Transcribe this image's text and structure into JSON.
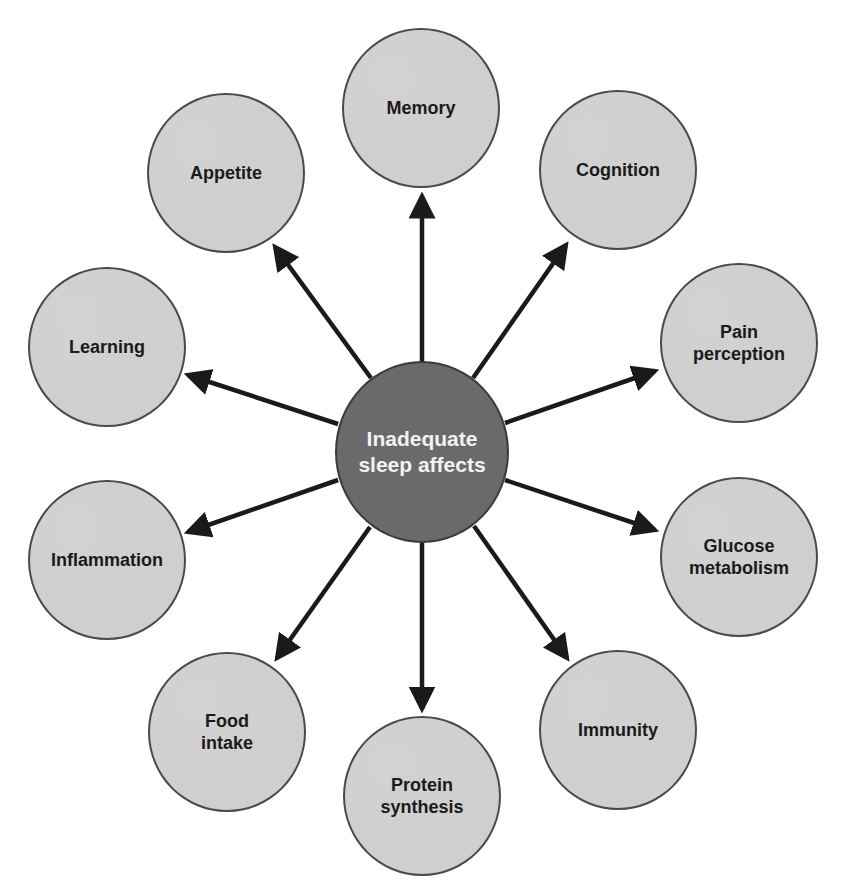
{
  "diagram": {
    "type": "hub-and-spoke",
    "colors": {
      "center_fill": "#6a6a6a",
      "center_text": "#f2f2f2",
      "outer_fill": "#cfcfcf",
      "outer_text": "#1a1a1a",
      "stroke": "#4a4a4a",
      "arrow": "#1a1a1a"
    },
    "center": {
      "label_line1": "Inadequate",
      "label_line2": "sleep affects"
    },
    "nodes": [
      {
        "id": "memory",
        "line1": "Memory",
        "line2": ""
      },
      {
        "id": "cognition",
        "line1": "Cognition",
        "line2": ""
      },
      {
        "id": "pain-perception",
        "line1": "Pain",
        "line2": "perception"
      },
      {
        "id": "glucose-metabolism",
        "line1": "Glucose",
        "line2": "metabolism"
      },
      {
        "id": "immunity",
        "line1": "Immunity",
        "line2": ""
      },
      {
        "id": "protein-synthesis",
        "line1": "Protein",
        "line2": "synthesis"
      },
      {
        "id": "food-intake",
        "line1": "Food",
        "line2": "intake"
      },
      {
        "id": "inflammation",
        "line1": "Inflammation",
        "line2": ""
      },
      {
        "id": "learning",
        "line1": "Learning",
        "line2": ""
      },
      {
        "id": "appetite",
        "line1": "Appetite",
        "line2": ""
      }
    ],
    "edges": [
      {
        "from": "center",
        "to": "memory"
      },
      {
        "from": "center",
        "to": "cognition"
      },
      {
        "from": "center",
        "to": "pain-perception"
      },
      {
        "from": "center",
        "to": "glucose-metabolism"
      },
      {
        "from": "center",
        "to": "immunity"
      },
      {
        "from": "center",
        "to": "protein-synthesis"
      },
      {
        "from": "center",
        "to": "food-intake"
      },
      {
        "from": "center",
        "to": "inflammation"
      },
      {
        "from": "center",
        "to": "learning"
      },
      {
        "from": "center",
        "to": "appetite"
      }
    ]
  }
}
